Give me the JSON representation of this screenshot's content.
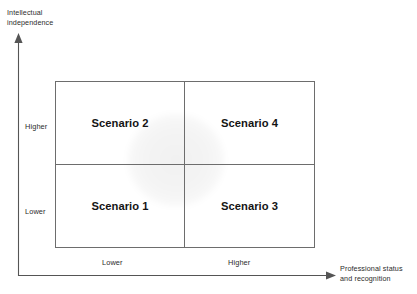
{
  "diagram": {
    "type": "2x2-matrix",
    "y_axis": {
      "title": "Intellectual\nindependence",
      "ticks": [
        {
          "label": "Higher",
          "position": "upper"
        },
        {
          "label": "Lower",
          "position": "lower"
        }
      ],
      "arrow": "up-arrow-icon"
    },
    "x_axis": {
      "title": "Professional status\nand recognition",
      "ticks": [
        {
          "label": "Lower",
          "position": "left"
        },
        {
          "label": "Higher",
          "position": "right"
        }
      ],
      "arrow": "right-arrow-icon"
    },
    "quadrants": [
      {
        "id": "top-left",
        "label": "Scenario 2"
      },
      {
        "id": "top-right",
        "label": "Scenario 4"
      },
      {
        "id": "bottom-left",
        "label": "Scenario 1"
      },
      {
        "id": "bottom-right",
        "label": "Scenario 3"
      }
    ],
    "colors": {
      "border": "#6d6d6d",
      "axis": "#555555",
      "text": "#2b2b2b",
      "label_text": "#141414",
      "background": "#ffffff",
      "watermark": "#f0f0f0"
    }
  }
}
